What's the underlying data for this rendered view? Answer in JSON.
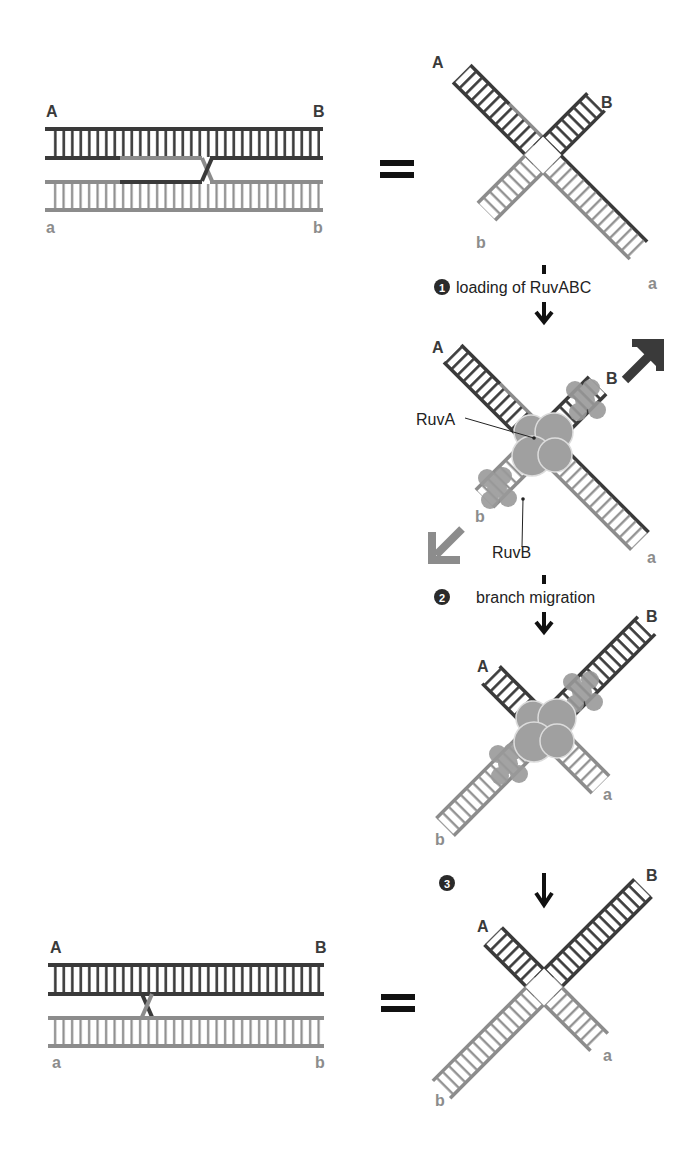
{
  "colors": {
    "dark_strand": "#3a3a3a",
    "light_strand": "#8c8c8c",
    "ruv_protein": "#9a9a9a",
    "arrow_black": "#111111",
    "step_circle": "#2a2a2a"
  },
  "top_linear": {
    "label_A": "A",
    "label_B": "B",
    "label_a": "a",
    "label_b": "b"
  },
  "top_equals": "=",
  "junction_1": {
    "label_A": "A",
    "label_B": "B",
    "label_a": "a",
    "label_b": "b"
  },
  "step1": {
    "number": "1",
    "text": "loading of RuvABC"
  },
  "junction_2": {
    "label_A": "A",
    "label_B": "B",
    "label_a": "a",
    "label_b": "b",
    "ruvA_label": "RuvA",
    "ruvB_label": "RuvB"
  },
  "step2": {
    "number": "2",
    "text": "branch migration"
  },
  "junction_3": {
    "label_A": "A",
    "label_B": "B",
    "label_a": "a",
    "label_b": "b"
  },
  "step3": {
    "number": "3"
  },
  "bottom_linear": {
    "label_A": "A",
    "label_B": "B",
    "label_a": "a",
    "label_b": "b"
  },
  "bottom_equals": "=",
  "junction_4": {
    "label_A": "A",
    "label_B": "B",
    "label_a": "a",
    "label_b": "b"
  }
}
